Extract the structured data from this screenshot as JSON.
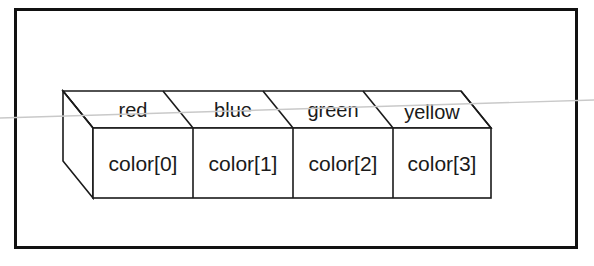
{
  "figure": {
    "border": {
      "color": "#111111",
      "x": 14,
      "y": 8,
      "width": 563,
      "height": 240,
      "stroke_width": 3
    },
    "line_color": "#1a1a1a",
    "fill_color": "#ffffff",
    "artifact_line": {
      "name": "scan-artifact-line",
      "color": "#c9c9c9",
      "x1": 0,
      "y1": 118,
      "x2": 594,
      "y2": 100
    },
    "box": {
      "front_left": 93,
      "front_right": 491,
      "front_top": 128,
      "front_bottom": 198,
      "depth_dx": -30,
      "depth_dy": -37,
      "cell_count": 4,
      "dividers_x": [
        193,
        293,
        393
      ]
    },
    "cells": [
      {
        "top_label": "red",
        "front_label": "color[0]"
      },
      {
        "top_label": "blue",
        "front_label": "color[1]"
      },
      {
        "top_label": "green",
        "front_label": "color[2]"
      },
      {
        "top_label": "yellow",
        "front_label": "color[3]"
      }
    ]
  }
}
